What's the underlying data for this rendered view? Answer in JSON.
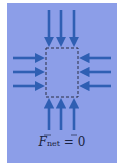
{
  "diagram": {
    "background_color": "#8c9ee8",
    "arrow_color": "#2f5fb3",
    "box": {
      "style": "dashed",
      "x": 46,
      "y": 48,
      "width": 32,
      "height": 49
    },
    "arrows": {
      "top": {
        "count": 3,
        "direction": "down"
      },
      "bottom": {
        "count": 3,
        "direction": "up"
      },
      "left": {
        "count": 3,
        "direction": "right"
      },
      "right": {
        "count": 3,
        "direction": "left"
      }
    },
    "equation": {
      "symbol": "F",
      "subscript": "net",
      "equals": "=",
      "result": "0"
    }
  }
}
